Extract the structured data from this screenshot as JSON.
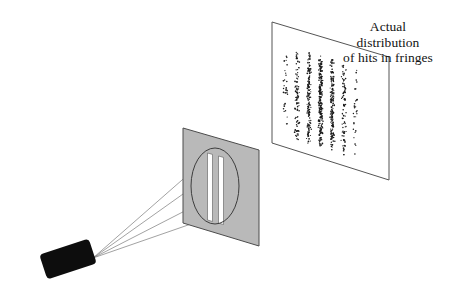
{
  "figure": {
    "background_color": "#ffffff",
    "width": 449,
    "height": 308
  },
  "caption": {
    "lines": [
      "Actual",
      "distribution",
      "of hits in fringes"
    ],
    "line1": "Actual",
    "line2": "distribution",
    "line3": "of hits in fringes",
    "color": "#121212",
    "align": "center"
  },
  "source": {
    "label": "electron-source",
    "fill_color": "#0d0d0d",
    "shape": "rounded-rectangle",
    "rotation_deg": -18,
    "x": 42,
    "y": 246,
    "width": 52,
    "height": 26
  },
  "rays": {
    "label": "particle-beam-rays",
    "count": 4,
    "stroke_color": "#7a7a7a",
    "stroke_width": 0.7,
    "origin": {
      "x": 93,
      "y": 258
    },
    "endpoints": [
      {
        "x": 214,
        "y": 152
      },
      {
        "x": 214,
        "y": 172
      },
      {
        "x": 214,
        "y": 196
      },
      {
        "x": 214,
        "y": 216
      }
    ]
  },
  "barrier": {
    "label": "double-slit-barrier",
    "fill_color": "#b9b9b9",
    "stroke_color": "#4c4c4c",
    "corners": [
      {
        "x": 183,
        "y": 128
      },
      {
        "x": 259,
        "y": 150
      },
      {
        "x": 259,
        "y": 246
      },
      {
        "x": 183,
        "y": 223
      }
    ]
  },
  "magnifier": {
    "label": "slit-magnifier-ellipse",
    "stroke_color": "#3d3d3d",
    "fill_color": "none",
    "center_x": 215,
    "center_y": 186,
    "radius_x": 24,
    "radius_y": 38
  },
  "slits": {
    "label": "two-slits",
    "count": 2,
    "fill_color": "#ffffff",
    "stroke_color": "#555555",
    "slit_a": {
      "x": 208,
      "y": 152,
      "width": 5,
      "height": 68
    },
    "slit_b": {
      "x": 219,
      "y": 155,
      "width": 5,
      "height": 68
    }
  },
  "screen": {
    "label": "detector-screen",
    "fill_color": "#ffffff",
    "stroke_color": "#555555",
    "corners": [
      {
        "x": 272,
        "y": 22
      },
      {
        "x": 389,
        "y": 57
      },
      {
        "x": 389,
        "y": 180
      },
      {
        "x": 272,
        "y": 143
      }
    ]
  },
  "fringes": {
    "label": "interference-fringe-hits",
    "dot_color": "#1a1a1a",
    "band_count": 7,
    "bands": [
      {
        "index": 1,
        "center_u": 0.115,
        "density": 0.13,
        "spread": 0.016
      },
      {
        "index": 2,
        "center_u": 0.215,
        "density": 0.4,
        "spread": 0.015
      },
      {
        "index": 3,
        "center_u": 0.315,
        "density": 0.72,
        "spread": 0.014
      },
      {
        "index": 4,
        "center_u": 0.415,
        "density": 1.0,
        "spread": 0.013
      },
      {
        "index": 5,
        "center_u": 0.515,
        "density": 0.72,
        "spread": 0.014
      },
      {
        "index": 6,
        "center_u": 0.615,
        "density": 0.4,
        "spread": 0.015
      },
      {
        "index": 7,
        "center_u": 0.715,
        "density": 0.13,
        "spread": 0.016
      }
    ],
    "region": {
      "u_min": 0.06,
      "u_max": 0.8,
      "v_min": 0.16,
      "v_max": 0.92
    },
    "total_dots": 980
  }
}
